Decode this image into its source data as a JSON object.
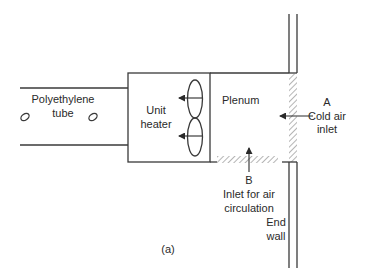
{
  "diagram": {
    "caption": "(a)",
    "components": {
      "tube": {
        "label_line1": "Polyethylene",
        "label_line2": "tube"
      },
      "heater": {
        "label_line1": "Unit",
        "label_line2": "heater"
      },
      "plenum": {
        "label": "Plenum"
      },
      "inlet_a": {
        "letter": "A",
        "label_line1": "Cold air",
        "label_line2": "inlet"
      },
      "inlet_b": {
        "letter": "B",
        "label_line1": "Inlet for air",
        "label_line2": "circulation"
      },
      "wall": {
        "label_line1": "End",
        "label_line2": "wall"
      }
    },
    "colors": {
      "line": "#3a3a3a",
      "text": "#2a2a2a",
      "background": "#ffffff"
    }
  }
}
